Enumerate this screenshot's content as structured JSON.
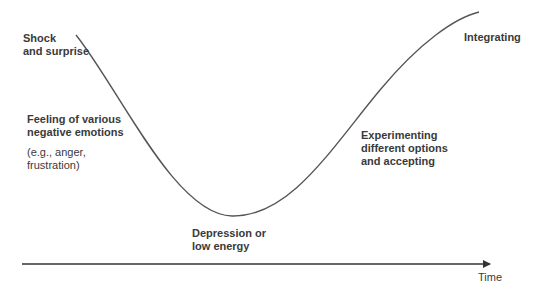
{
  "diagram": {
    "type": "change-curve",
    "colors": {
      "line": "#555555",
      "text": "#3a3a3a",
      "background": "#ffffff"
    },
    "axis": {
      "label": "Time",
      "direction": "horizontal-right"
    },
    "stages": [
      {
        "id": "shock",
        "lines": [
          "Shock",
          "and surprise"
        ],
        "bold": true
      },
      {
        "id": "negative-emotions",
        "lines": [
          "Feeling of various",
          "negative emotions"
        ],
        "bold": true,
        "note_lines": [
          "(e.g., anger,",
          "frustration)"
        ]
      },
      {
        "id": "depression",
        "lines": [
          "Depression or",
          "low energy"
        ],
        "bold": true
      },
      {
        "id": "experimenting",
        "lines": [
          "Experimenting",
          "different options",
          "and accepting"
        ],
        "bold": true
      },
      {
        "id": "integrating",
        "lines": [
          "Integrating"
        ],
        "bold": true
      }
    ],
    "curve_points": [
      [
        76,
        35
      ],
      [
        110,
        85
      ],
      [
        150,
        150
      ],
      [
        190,
        198
      ],
      [
        232,
        216
      ],
      [
        270,
        205
      ],
      [
        320,
        160
      ],
      [
        370,
        95
      ],
      [
        420,
        45
      ],
      [
        479,
        12
      ]
    ]
  }
}
